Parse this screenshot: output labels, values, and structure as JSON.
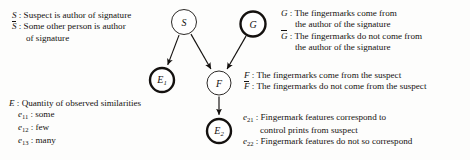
{
  "legend_s": {
    "lines": [
      {
        "symbol": "S",
        "overbar": false,
        "text": ": Suspect is author of signature",
        "indent": 0
      },
      {
        "symbol": "S",
        "overbar": true,
        "text": ": Some other person is author",
        "indent": 0
      },
      {
        "symbol": "",
        "overbar": false,
        "text": "of signature",
        "indent": 1
      }
    ]
  },
  "legend_e": {
    "lines": [
      {
        "symbol": "E",
        "overbar": false,
        "sub": "",
        "text": ": Quantity of observed similarities",
        "indent": 0
      },
      {
        "symbol": "e",
        "overbar": false,
        "sub": "11",
        "text": ": some",
        "indent": 2
      },
      {
        "symbol": "e",
        "overbar": false,
        "sub": "12",
        "text": ": few",
        "indent": 2
      },
      {
        "symbol": "e",
        "overbar": false,
        "sub": "13",
        "text": ": many",
        "indent": 2
      }
    ]
  },
  "legend_g": {
    "lines": [
      {
        "symbol": "G",
        "overbar": false,
        "text": ": The fingermarks come from",
        "indent": 0
      },
      {
        "symbol": "",
        "overbar": false,
        "text": "the author of the signature",
        "indent": 1
      },
      {
        "symbol": "G",
        "overbar": true,
        "text": ": The fingermarks do not come from",
        "indent": 0
      },
      {
        "symbol": "",
        "overbar": false,
        "text": "the author of the signature",
        "indent": 1
      }
    ]
  },
  "legend_f": {
    "lines": [
      {
        "symbol": "F",
        "overbar": false,
        "text": ": The fingermarks come from the suspect",
        "indent": 0
      },
      {
        "symbol": "F",
        "overbar": true,
        "text": ": The fingermarks do not come from the suspect",
        "indent": 0
      }
    ]
  },
  "legend_e2": {
    "lines": [
      {
        "symbol": "e",
        "sub": "21",
        "text": ": Fingermark features correspond to",
        "indent": 0
      },
      {
        "symbol": "",
        "sub": "",
        "text": "control prints from suspect",
        "indent": 3
      },
      {
        "symbol": "e",
        "sub": "22",
        "text": ": Fingermark features do not so correspond",
        "indent": 0
      }
    ]
  },
  "graph": {
    "type": "bayesian-network",
    "stroke_color": "#14110f",
    "node_fill": "#ffffff",
    "nodes": [
      {
        "id": "S",
        "label": "S",
        "sub": "",
        "cx": 184,
        "cy": 22,
        "r": 12.5,
        "stroke_width": 0.9,
        "style": "thin"
      },
      {
        "id": "G",
        "label": "G",
        "sub": "",
        "cx": 253,
        "cy": 24,
        "r": 12.5,
        "stroke_width": 2.4,
        "style": "thick"
      },
      {
        "id": "E1",
        "label": "E",
        "sub": "1",
        "cx": 162,
        "cy": 80,
        "r": 12.0,
        "stroke_width": 2.4,
        "style": "thick"
      },
      {
        "id": "F",
        "label": "F",
        "sub": "",
        "cx": 219,
        "cy": 83,
        "r": 12.0,
        "stroke_width": 0.9,
        "style": "thin"
      },
      {
        "id": "E2",
        "label": "E",
        "sub": "2",
        "cx": 219,
        "cy": 131,
        "r": 12.0,
        "stroke_width": 2.4,
        "style": "thick"
      }
    ],
    "edges": [
      {
        "from": "S",
        "to": "E1"
      },
      {
        "from": "S",
        "to": "F"
      },
      {
        "from": "G",
        "to": "F"
      },
      {
        "from": "F",
        "to": "E2"
      }
    ]
  }
}
